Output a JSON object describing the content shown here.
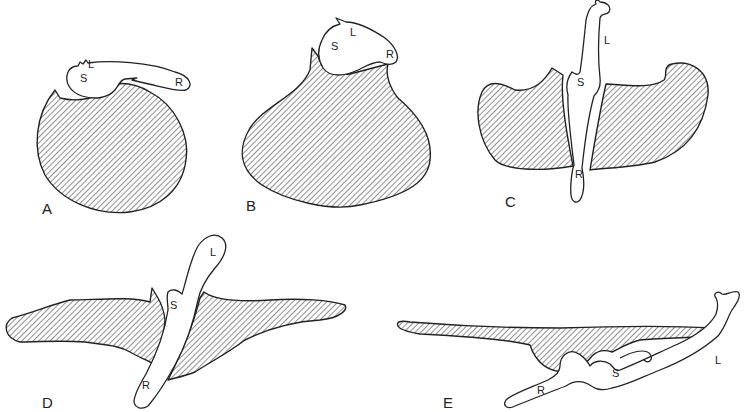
{
  "figure": {
    "colors": {
      "ink": "#222222",
      "background": "#ffffff",
      "hatch": "#333333"
    },
    "panels": [
      {
        "id": "A",
        "label": "A",
        "parts": {
          "S": "S",
          "L": "L",
          "R": "R"
        }
      },
      {
        "id": "B",
        "label": "B",
        "parts": {
          "S": "S",
          "L": "L",
          "R": "R"
        }
      },
      {
        "id": "C",
        "label": "C",
        "parts": {
          "S": "S",
          "L": "L",
          "R": "R"
        }
      },
      {
        "id": "D",
        "label": "D",
        "parts": {
          "S": "S",
          "L": "L",
          "R": "R"
        }
      },
      {
        "id": "E",
        "label": "E",
        "parts": {
          "S": "S",
          "L": "L",
          "R": "R"
        }
      }
    ]
  }
}
